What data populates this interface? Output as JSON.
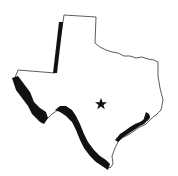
{
  "map": {
    "subject": "Texas state outline",
    "marker": {
      "type": "star",
      "label": "",
      "color": "#111111"
    },
    "colors": {
      "background": "#ffffff",
      "outline": "#333333",
      "border_highlight": "#111111"
    },
    "highlighted_borders": [
      "western-panhandle-border",
      "rio-grande-border"
    ]
  }
}
